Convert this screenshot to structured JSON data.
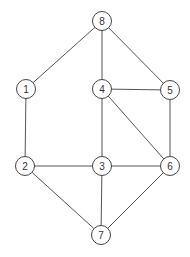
{
  "diagram": {
    "type": "undirected-graph",
    "node_radius": 9.5,
    "colors": {
      "edge": "#555555",
      "node_stroke": "#444444",
      "node_fill": "#ffffff",
      "label": "#333333"
    },
    "nodes": [
      {
        "id": "1",
        "label": "1",
        "x": 26,
        "y": 89
      },
      {
        "id": "2",
        "label": "2",
        "x": 25,
        "y": 166
      },
      {
        "id": "3",
        "label": "3",
        "x": 102,
        "y": 166
      },
      {
        "id": "4",
        "label": "4",
        "x": 102,
        "y": 89
      },
      {
        "id": "5",
        "label": "5",
        "x": 170,
        "y": 90
      },
      {
        "id": "6",
        "label": "6",
        "x": 170,
        "y": 166
      },
      {
        "id": "7",
        "label": "7",
        "x": 101,
        "y": 235
      },
      {
        "id": "8",
        "label": "8",
        "x": 102,
        "y": 21
      }
    ],
    "edges": [
      {
        "from": "8",
        "to": "1"
      },
      {
        "from": "8",
        "to": "4"
      },
      {
        "from": "8",
        "to": "5"
      },
      {
        "from": "1",
        "to": "2"
      },
      {
        "from": "4",
        "to": "5"
      },
      {
        "from": "4",
        "to": "3"
      },
      {
        "from": "4",
        "to": "6"
      },
      {
        "from": "5",
        "to": "6"
      },
      {
        "from": "2",
        "to": "3"
      },
      {
        "from": "3",
        "to": "6"
      },
      {
        "from": "2",
        "to": "7"
      },
      {
        "from": "3",
        "to": "7"
      },
      {
        "from": "6",
        "to": "7"
      }
    ]
  }
}
